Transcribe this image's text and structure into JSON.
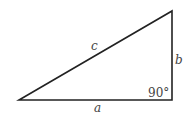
{
  "diagram": {
    "type": "right-triangle",
    "labels": {
      "hypotenuse": "c",
      "vertical_leg": "b",
      "horizontal_leg": "a",
      "right_angle": "90°"
    },
    "colors": {
      "stroke": "#222222",
      "label": "#444444",
      "background": "#ffffff"
    }
  }
}
